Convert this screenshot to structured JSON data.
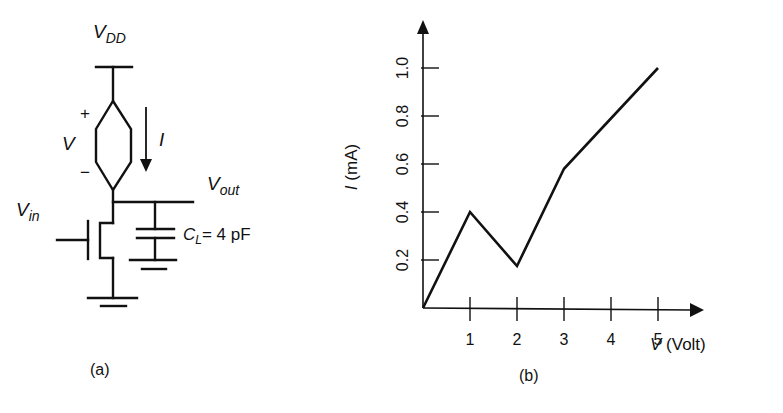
{
  "colors": {
    "ink": "#111111",
    "background": "#ffffff"
  },
  "circuit": {
    "label_vdd": "V",
    "label_vdd_sub": "DD",
    "label_v": "V",
    "label_plus": "+",
    "label_minus": "−",
    "label_i": "I",
    "label_vout": "V",
    "label_vout_sub": "out",
    "label_vin": "V",
    "label_vin_sub": "in",
    "label_cl": "C",
    "label_cl_sub": "L",
    "label_cl_value": "= 4 pF",
    "caption": "(a)"
  },
  "chart_data": {
    "type": "line",
    "title": "",
    "xlabel": "V (Volt)",
    "ylabel": "I (mA)",
    "xlabel_var": "V",
    "xlabel_unit": " (Volt)",
    "ylabel_var": "I",
    "ylabel_unit": " (mA)",
    "x_ticks": [
      "1",
      "2",
      "3",
      "4",
      "5"
    ],
    "y_ticks": [
      "0.2",
      "0.4",
      "0.6",
      "0.8",
      "1.0"
    ],
    "xlim": [
      0,
      5.8
    ],
    "ylim": [
      0,
      1.18
    ],
    "grid": false,
    "legend": null,
    "series": [
      {
        "name": "I-V characteristic",
        "x": [
          0,
          1,
          2,
          3,
          5
        ],
        "y": [
          0,
          0.4,
          0.175,
          0.58,
          1.0
        ]
      }
    ],
    "caption": "(b)"
  }
}
